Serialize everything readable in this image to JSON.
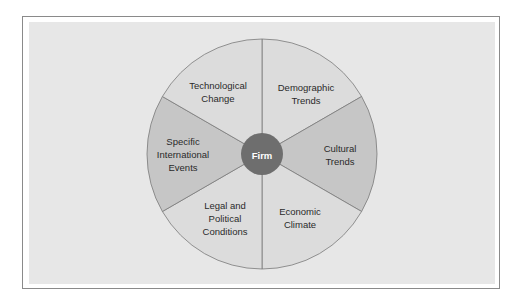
{
  "diagram": {
    "type": "wheel",
    "center": {
      "label": "Firm",
      "color": "#6e6e6e"
    },
    "colors": {
      "light_sector": "#dcdcdc",
      "dark_sector": "#c6c6c6",
      "outline": "#7a7a7a",
      "panel": "#e7e7e7"
    },
    "sectors": [
      {
        "lines": [
          "Technological",
          "Change"
        ],
        "shade": "light"
      },
      {
        "lines": [
          "Demographic",
          "Trends"
        ],
        "shade": "light"
      },
      {
        "lines": [
          "Cultural",
          "Trends"
        ],
        "shade": "dark"
      },
      {
        "lines": [
          "Economic",
          "Climate"
        ],
        "shade": "light"
      },
      {
        "lines": [
          "Legal and",
          "Political",
          "Conditions"
        ],
        "shade": "light"
      },
      {
        "lines": [
          "Specific",
          "International",
          "Events"
        ],
        "shade": "dark"
      }
    ]
  }
}
